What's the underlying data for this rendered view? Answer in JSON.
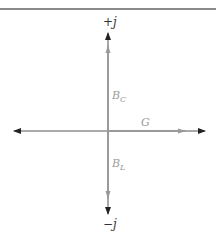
{
  "diagram": {
    "title": "",
    "type": "phasor-admittance-diagram",
    "axes": {
      "positive_imag_label": "+j",
      "negative_imag_label": "−j"
    },
    "vectors": [
      {
        "name": "G",
        "label": "G",
        "direction": "right",
        "color": "#9a9a9a"
      },
      {
        "name": "BC",
        "label_main": "B",
        "label_sub": "C",
        "direction": "up",
        "color": "#9a9a9a"
      },
      {
        "name": "BL",
        "label_main": "B",
        "label_sub": "L",
        "direction": "down",
        "color": "#9a9a9a"
      }
    ],
    "colors": {
      "axis": "#222222",
      "vector": "#9a9a9a",
      "label": "#9a9a9a",
      "axis_label": "#333333",
      "border": "#8a8a8a"
    }
  }
}
